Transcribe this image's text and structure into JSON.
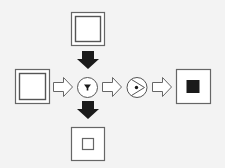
{
  "diagram": {
    "title": "",
    "background": "#f3f3f3",
    "stroke_color": "#555555",
    "fill_dark": "#1a1a1a",
    "box_fill": "#ffffff",
    "nodes": [
      {
        "id": "top-source",
        "type": "box-double-border",
        "label": ""
      },
      {
        "id": "left-source",
        "type": "box-double-border",
        "label": ""
      },
      {
        "id": "filter-junction",
        "type": "circle",
        "glyph": "filter-icon",
        "label": ""
      },
      {
        "id": "view-junction",
        "type": "circle",
        "glyph": "eye-play-icon",
        "label": ""
      },
      {
        "id": "right-output",
        "type": "box-filled-inner-square",
        "label": ""
      },
      {
        "id": "bottom-output",
        "type": "box-hollow-inner-square",
        "label": ""
      }
    ],
    "edges": [
      {
        "from": "top-source",
        "to": "filter-junction",
        "style": "solid-black-arrow",
        "direction": "down"
      },
      {
        "from": "left-source",
        "to": "filter-junction",
        "style": "hollow-arrow",
        "direction": "right"
      },
      {
        "from": "filter-junction",
        "to": "view-junction",
        "style": "hollow-arrow",
        "direction": "right"
      },
      {
        "from": "view-junction",
        "to": "right-output",
        "style": "hollow-arrow",
        "direction": "right"
      },
      {
        "from": "filter-junction",
        "to": "bottom-output",
        "style": "solid-black-arrow",
        "direction": "down"
      }
    ]
  }
}
